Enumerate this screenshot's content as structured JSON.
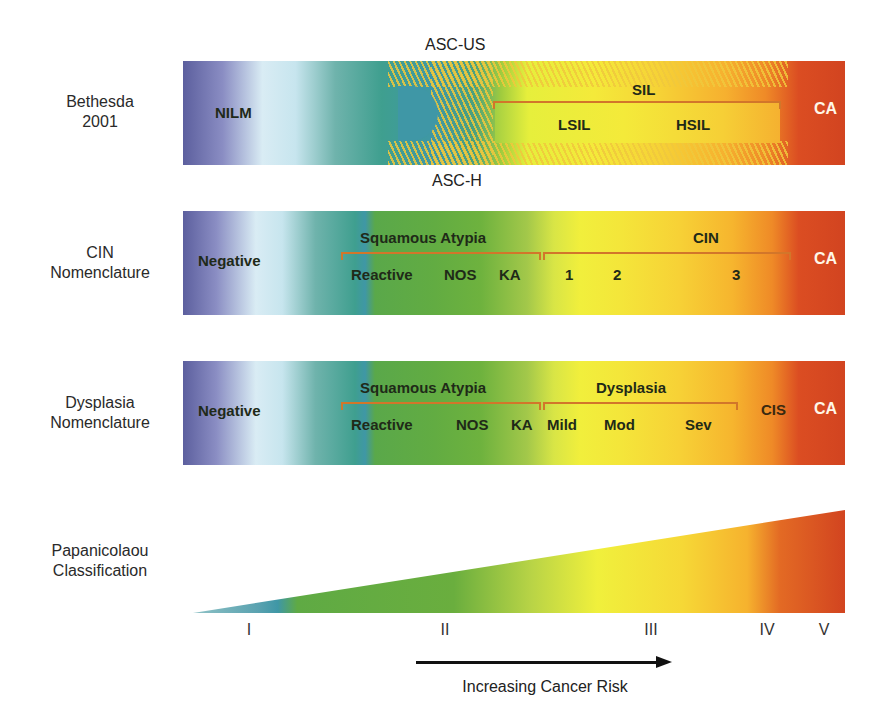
{
  "rows": {
    "bethesda": {
      "label_line1": "Bethesda",
      "label_line2": "2001",
      "above_label": "ASC-US",
      "below_label": "ASC-H",
      "nilm": "NILM",
      "sil": "SIL",
      "lsil": "LSIL",
      "hsil": "HSIL",
      "ca": "CA"
    },
    "cin": {
      "label_line1": "CIN",
      "label_line2": "Nomenclature",
      "negative": "Negative",
      "squamous_atypia": "Squamous Atypia",
      "reactive": "Reactive",
      "nos": "NOS",
      "ka": "KA",
      "cin_group": "CIN",
      "grade1": "1",
      "grade2": "2",
      "grade3": "3",
      "ca": "CA"
    },
    "dysplasia": {
      "label_line1": "Dysplasia",
      "label_line2": "Nomenclature",
      "negative": "Negative",
      "squamous_atypia": "Squamous Atypia",
      "reactive": "Reactive",
      "nos": "NOS",
      "ka": "KA",
      "dysplasia_group": "Dysplasia",
      "mild": "Mild",
      "mod": "Mod",
      "sev": "Sev",
      "cis": "CIS",
      "ca": "CA"
    },
    "papanicolaou": {
      "label_line1": "Papanicolaou",
      "label_line2": "Classification",
      "classes": [
        "I",
        "II",
        "III",
        "IV",
        "V"
      ]
    }
  },
  "arrow": {
    "label": "Increasing Cancer Risk"
  },
  "colors": {
    "negative_blue": "#5c5f9e",
    "pale": "#d9ecf4",
    "teal": "#3f9f8f",
    "green": "#62ac42",
    "yellow": "#f1ef3c",
    "orange": "#f6b52e",
    "red": "#d24420",
    "bracket": "#d2762a"
  }
}
